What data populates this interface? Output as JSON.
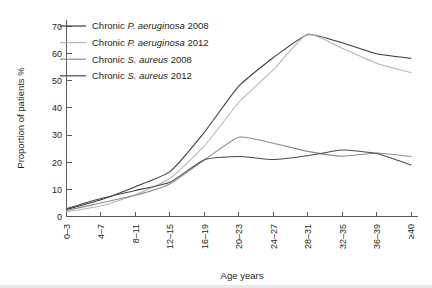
{
  "chart_data": {
    "type": "line",
    "title": "",
    "xlabel": "Age years",
    "ylabel": "Proportion of patients %",
    "categories": [
      "0–3",
      "4–7",
      "8–11",
      "12–15",
      "16–19",
      "20–23",
      "24–27",
      "28–31",
      "32–35",
      "36–39",
      "≥40"
    ],
    "ylim": [
      0,
      70
    ],
    "yticks": [
      0,
      10,
      20,
      30,
      40,
      50,
      60,
      70
    ],
    "ytick_labels": [
      "0",
      "10",
      "20",
      "30",
      "40",
      "50",
      "60",
      "70"
    ],
    "grid": false,
    "legend_position": "top-left",
    "series": [
      {
        "name": "Chronic P. aeruginosa 2008",
        "label_prefix": "Chronic ",
        "label_species": "P. aeruginosa",
        "label_suffix": " 2008",
        "color": "#3b3b3b",
        "values": [
          2.6,
          6.2,
          11.0,
          16.5,
          31.0,
          48.0,
          58.5,
          67.0,
          64.0,
          60.0,
          58.3
        ]
      },
      {
        "name": "Chronic P. aeruginosa 2012",
        "label_prefix": "Chronic ",
        "label_species": "P. aeruginosa",
        "label_suffix": " 2012",
        "color": "#b4b4b4",
        "values": [
          1.8,
          3.9,
          8.0,
          14.0,
          26.0,
          42.0,
          54.0,
          67.2,
          62.0,
          56.5,
          53.0
        ]
      },
      {
        "name": "Chronic S. aureus 2008",
        "label_prefix": "Chronic ",
        "label_species": "S. aureus",
        "label_suffix": " 2008",
        "color": "#8a8a8a",
        "values": [
          2.2,
          5.0,
          7.8,
          12.0,
          20.8,
          29.2,
          27.0,
          24.0,
          22.2,
          23.4,
          22.1
        ]
      },
      {
        "name": "Chronic S. aureus 2012",
        "label_prefix": "Chronic ",
        "label_species": "S. aureus",
        "label_suffix": " 2012",
        "color": "#4a4a4a",
        "values": [
          2.9,
          6.6,
          9.6,
          12.6,
          20.9,
          22.1,
          21.0,
          22.4,
          24.5,
          23.2,
          19.0
        ]
      }
    ]
  },
  "axes": {
    "y_axis_title": "Proportion of patients %",
    "x_axis_title": "Age years"
  }
}
